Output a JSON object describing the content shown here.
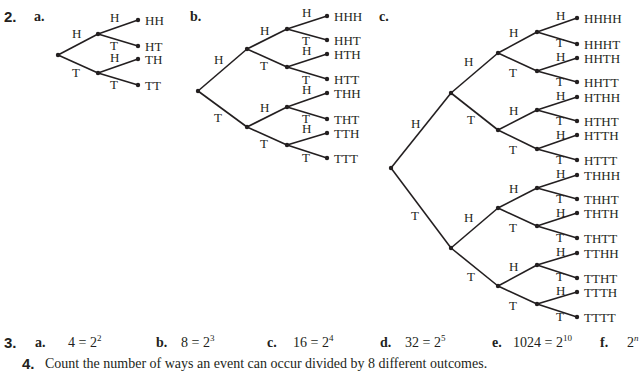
{
  "problem2": {
    "number": "2.",
    "parts": [
      {
        "label": "a.",
        "label_pos": [
          34,
          22
        ]
      },
      {
        "label": "b.",
        "label_pos": [
          190,
          22
        ]
      },
      {
        "label": "c.",
        "label_pos": [
          379,
          22
        ]
      }
    ],
    "trees": [
      {
        "id": "a",
        "nodes": {
          "r": [
            58,
            55
          ],
          "H": [
            98,
            34
          ],
          "T": [
            98,
            73
          ],
          "HH": [
            138,
            20
          ],
          "HT": [
            138,
            46
          ],
          "TH": [
            138,
            59
          ],
          "TT": [
            138,
            85
          ]
        },
        "edges": [
          {
            "from": "r",
            "to": "H",
            "label": "H",
            "lpos": [
              72,
              38
            ]
          },
          {
            "from": "r",
            "to": "T",
            "label": "T",
            "lpos": [
              72,
              77
            ]
          },
          {
            "from": "H",
            "to": "HH",
            "label": "H",
            "lpos": [
              110,
              22
            ]
          },
          {
            "from": "H",
            "to": "HT",
            "label": "T",
            "lpos": [
              110,
              50
            ]
          },
          {
            "from": "T",
            "to": "TH",
            "label": "H",
            "lpos": [
              110,
              62
            ]
          },
          {
            "from": "T",
            "to": "TT",
            "label": "T",
            "lpos": [
              110,
              89
            ]
          }
        ],
        "leaves": [
          {
            "node": "HH",
            "text": "HH"
          },
          {
            "node": "HT",
            "text": "HT"
          },
          {
            "node": "TH",
            "text": "TH"
          },
          {
            "node": "TT",
            "text": "TT"
          }
        ]
      },
      {
        "id": "b",
        "nodes": {
          "r": [
            198,
            91
          ],
          "H": [
            247,
            49
          ],
          "T": [
            247,
            127
          ],
          "HH": [
            287,
            29
          ],
          "HT": [
            287,
            67
          ],
          "TH": [
            287,
            107
          ],
          "TT": [
            287,
            145
          ],
          "HHH": [
            327,
            16
          ],
          "HHT": [
            327,
            40
          ],
          "HTH": [
            327,
            54
          ],
          "HTT": [
            327,
            79
          ],
          "THH": [
            327,
            93
          ],
          "THT": [
            327,
            119
          ],
          "TTH": [
            327,
            133
          ],
          "TTT": [
            327,
            158
          ]
        },
        "edges": [
          {
            "from": "r",
            "to": "H",
            "label": "H",
            "lpos": [
              214,
              64
            ]
          },
          {
            "from": "r",
            "to": "T",
            "label": "T",
            "lpos": [
              214,
              122
            ]
          },
          {
            "from": "H",
            "to": "HH",
            "label": "H",
            "lpos": [
              260,
              35
            ]
          },
          {
            "from": "H",
            "to": "HT",
            "label": "T",
            "lpos": [
              260,
              70
            ]
          },
          {
            "from": "T",
            "to": "TH",
            "label": "H",
            "lpos": [
              260,
              112
            ]
          },
          {
            "from": "T",
            "to": "TT",
            "label": "T",
            "lpos": [
              260,
              148
            ]
          },
          {
            "from": "HH",
            "to": "HHH",
            "label": "H",
            "lpos": [
              302,
              17
            ]
          },
          {
            "from": "HH",
            "to": "HHT",
            "label": "T",
            "lpos": [
              302,
              45
            ]
          },
          {
            "from": "HT",
            "to": "HTH",
            "label": "H",
            "lpos": [
              302,
              55
            ]
          },
          {
            "from": "HT",
            "to": "HTT",
            "label": "T",
            "lpos": [
              302,
              84
            ]
          },
          {
            "from": "TH",
            "to": "THH",
            "label": "H",
            "lpos": [
              302,
              94
            ]
          },
          {
            "from": "TH",
            "to": "THT",
            "label": "T",
            "lpos": [
              302,
              123
            ]
          },
          {
            "from": "TT",
            "to": "TTH",
            "label": "H",
            "lpos": [
              302,
              133
            ]
          },
          {
            "from": "TT",
            "to": "TTT",
            "label": "T",
            "lpos": [
              302,
              162
            ]
          }
        ],
        "leaves": [
          {
            "node": "HHH",
            "text": "HHH"
          },
          {
            "node": "HHT",
            "text": "HHT"
          },
          {
            "node": "HTH",
            "text": "HTH"
          },
          {
            "node": "HTT",
            "text": "HTT"
          },
          {
            "node": "THH",
            "text": "THH"
          },
          {
            "node": "THT",
            "text": "THT"
          },
          {
            "node": "TTH",
            "text": "TTH"
          },
          {
            "node": "TTT",
            "text": "TTT"
          }
        ]
      },
      {
        "id": "c",
        "nodes": {
          "r": [
            391,
            168
          ],
          "H": [
            451,
            93
          ],
          "T": [
            451,
            248
          ],
          "HH": [
            498,
            53
          ],
          "HT": [
            498,
            130
          ],
          "TH": [
            498,
            208
          ],
          "TT": [
            498,
            286
          ],
          "HHH": [
            537,
            32
          ],
          "HHT": [
            537,
            71
          ],
          "HTH": [
            537,
            110
          ],
          "HTT": [
            537,
            149
          ],
          "THH": [
            537,
            188
          ],
          "THT": [
            537,
            226
          ],
          "TTH": [
            537,
            265
          ],
          "TTT": [
            537,
            304
          ],
          "HHHH": [
            577,
            18
          ],
          "HHHT": [
            577,
            44
          ],
          "HHTH": [
            577,
            58
          ],
          "HHTT": [
            577,
            82
          ],
          "HTHH": [
            577,
            97
          ],
          "HTHT": [
            577,
            121
          ],
          "HTTH": [
            577,
            135
          ],
          "HTTT": [
            577,
            160
          ],
          "THHH": [
            577,
            175
          ],
          "THHT": [
            577,
            199
          ],
          "THTH": [
            577,
            213
          ],
          "THTT": [
            577,
            238
          ],
          "TTHH": [
            577,
            253
          ],
          "TTHT": [
            577,
            278
          ],
          "TTTH": [
            577,
            292
          ],
          "TTTT": [
            577,
            317
          ]
        },
        "edges": [
          {
            "from": "r",
            "to": "H",
            "label": "H",
            "lpos": [
              411,
              128
            ]
          },
          {
            "from": "r",
            "to": "T",
            "label": "T",
            "lpos": [
              411,
              220
            ]
          },
          {
            "from": "H",
            "to": "HH",
            "label": "H",
            "lpos": [
              464,
              66
            ]
          },
          {
            "from": "H",
            "to": "HT",
            "label": "T",
            "lpos": [
              467,
              124
            ]
          },
          {
            "from": "T",
            "to": "TH",
            "label": "H",
            "lpos": [
              464,
              222
            ]
          },
          {
            "from": "T",
            "to": "TT",
            "label": "T",
            "lpos": [
              467,
              281
            ]
          },
          {
            "from": "HH",
            "to": "HHH",
            "label": "H",
            "lpos": [
              509,
              37
            ]
          },
          {
            "from": "HH",
            "to": "HHT",
            "label": "T",
            "lpos": [
              509,
              77
            ]
          },
          {
            "from": "HT",
            "to": "HTH",
            "label": "H",
            "lpos": [
              509,
              115
            ]
          },
          {
            "from": "HT",
            "to": "HTT",
            "label": "T",
            "lpos": [
              509,
              154
            ]
          },
          {
            "from": "TH",
            "to": "THH",
            "label": "H",
            "lpos": [
              509,
              193
            ]
          },
          {
            "from": "TH",
            "to": "THT",
            "label": "T",
            "lpos": [
              509,
              232
            ]
          },
          {
            "from": "TT",
            "to": "TTH",
            "label": "H",
            "lpos": [
              509,
              271
            ]
          },
          {
            "from": "TT",
            "to": "TTT",
            "label": "T",
            "lpos": [
              509,
              310
            ]
          },
          {
            "from": "HHH",
            "to": "HHHH",
            "label": "H",
            "lpos": [
              556,
              20
            ]
          },
          {
            "from": "HHH",
            "to": "HHHT",
            "label": "T",
            "lpos": [
              556,
              47
            ]
          },
          {
            "from": "HHT",
            "to": "HHTH",
            "label": "H",
            "lpos": [
              556,
              61
            ]
          },
          {
            "from": "HHT",
            "to": "HHTT",
            "label": "T",
            "lpos": [
              556,
              86
            ]
          },
          {
            "from": "HTH",
            "to": "HTHH",
            "label": "H",
            "lpos": [
              556,
              100
            ]
          },
          {
            "from": "HTH",
            "to": "HTHT",
            "label": "T",
            "lpos": [
              556,
              125
            ]
          },
          {
            "from": "HTT",
            "to": "HTTH",
            "label": "H",
            "lpos": [
              556,
              139
            ]
          },
          {
            "from": "HTT",
            "to": "HTTT",
            "label": "T",
            "lpos": [
              556,
              164
            ]
          },
          {
            "from": "THH",
            "to": "THHH",
            "label": "H",
            "lpos": [
              556,
              178
            ]
          },
          {
            "from": "THH",
            "to": "THHT",
            "label": "T",
            "lpos": [
              556,
              203
            ]
          },
          {
            "from": "THT",
            "to": "THTH",
            "label": "H",
            "lpos": [
              556,
              217
            ]
          },
          {
            "from": "THT",
            "to": "THTT",
            "label": "T",
            "lpos": [
              556,
              242
            ]
          },
          {
            "from": "TTH",
            "to": "TTHH",
            "label": "H",
            "lpos": [
              556,
              256
            ]
          },
          {
            "from": "TTH",
            "to": "TTHT",
            "label": "T",
            "lpos": [
              556,
              281
            ]
          },
          {
            "from": "TTT",
            "to": "TTTH",
            "label": "H",
            "lpos": [
              556,
              295
            ]
          },
          {
            "from": "TTT",
            "to": "TTTT",
            "label": "T",
            "lpos": [
              556,
              321
            ]
          }
        ],
        "leaves": [
          {
            "node": "HHHH",
            "text": "HHHH"
          },
          {
            "node": "HHHT",
            "text": "HHHT"
          },
          {
            "node": "HHTH",
            "text": "HHTH"
          },
          {
            "node": "HHTT",
            "text": "HHTT"
          },
          {
            "node": "HTHH",
            "text": "HTHH"
          },
          {
            "node": "HTHT",
            "text": "HTHT"
          },
          {
            "node": "HTTH",
            "text": "HTTH"
          },
          {
            "node": "HTTT",
            "text": "HTTT"
          },
          {
            "node": "THHH",
            "text": "THHH"
          },
          {
            "node": "THHT",
            "text": "THHT"
          },
          {
            "node": "THTH",
            "text": "THTH"
          },
          {
            "node": "THTT",
            "text": "THTT"
          },
          {
            "node": "TTHH",
            "text": "TTHH"
          },
          {
            "node": "TTHT",
            "text": "TTHT"
          },
          {
            "node": "TTTH",
            "text": "TTTH"
          },
          {
            "node": "TTTT",
            "text": "TTTT"
          }
        ]
      }
    ]
  },
  "problem3": {
    "number": "3.",
    "answers": [
      {
        "label": "a.",
        "base": "4 = 2",
        "exp": "2",
        "x_label": 35,
        "x_value": 68
      },
      {
        "label": "b.",
        "base": "8 = 2",
        "exp": "3",
        "x_label": 156,
        "x_value": 181
      },
      {
        "label": "c.",
        "base": "16 = 2",
        "exp": "4",
        "x_label": 267,
        "x_value": 293
      },
      {
        "label": "d.",
        "base": "32 = 2",
        "exp": "5",
        "x_label": 380,
        "x_value": 405
      },
      {
        "label": "e.",
        "base": "1024 = 2",
        "exp": "10",
        "x_label": 492,
        "x_value": 513
      },
      {
        "label": "f.",
        "base": "2",
        "exp": "n",
        "x_label": 600,
        "x_value": 627
      }
    ]
  },
  "problem4": {
    "number": "4.",
    "text": "Count the number of ways an event can occur divided by 8 different outcomes."
  }
}
